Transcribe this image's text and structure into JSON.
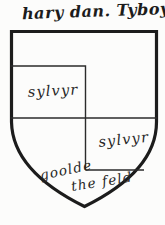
{
  "page": {
    "title": "hary dan. Tyboyn"
  },
  "shield": {
    "quarter1_label": "sylvyr",
    "quarter4_label": "sylvyr",
    "field_label_word1": "goolde",
    "field_label_word2": "the feld"
  },
  "colors": {
    "paper": "#fcfcfb",
    "ink": "#1c1c1c"
  }
}
